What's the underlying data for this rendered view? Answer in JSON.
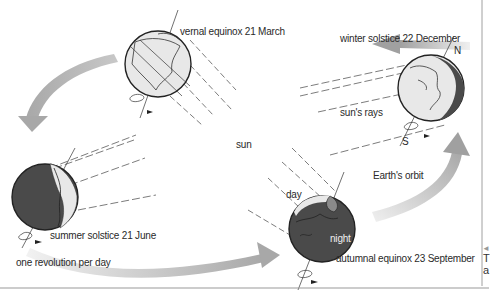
{
  "diagram": {
    "center_label": "sun",
    "orbit_label": "Earth's orbit",
    "rays_label": "sun's rays",
    "rotation_label": "one revolution per day",
    "positions": [
      {
        "id": "vernal",
        "label": "vernal equinox 21 March"
      },
      {
        "id": "winter",
        "label": "winter solstice 22 December",
        "pole_north": "N",
        "pole_south": "S"
      },
      {
        "id": "summer",
        "label": "summer solstice 21 June"
      },
      {
        "id": "autumnal",
        "label": "autumnal equinox 23 September",
        "day_label": "day",
        "night_label": "night"
      }
    ],
    "colors": {
      "arrow": "#b8b8b8",
      "earth_light": "#e6e6e6",
      "earth_dark": "#4a4a4a",
      "line": "#333333"
    }
  },
  "side_text": {
    "arrow": "◄",
    "line1": "T",
    "line2": "a"
  }
}
